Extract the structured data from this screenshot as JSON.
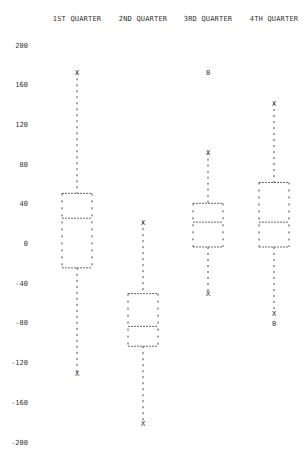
{
  "chart_data": {
    "type": "boxplot",
    "title": "",
    "xlabel": "",
    "ylabel": "",
    "categories": [
      "1ST QUARTER",
      "2ND QUARTER",
      "3RD QUARTER",
      "4TH QUARTER"
    ],
    "y_ticks": [
      "200",
      "160",
      "120",
      "80",
      "40",
      "0",
      "-40",
      "-80",
      "-120",
      "-160",
      "-200"
    ],
    "ylim": [
      -200,
      200
    ],
    "grid": false,
    "legend": null,
    "series": [
      {
        "name": "1ST QUARTER",
        "whisker_high": 173,
        "q3": 51,
        "median": 26,
        "q1": -24,
        "whisker_low": -130,
        "outliers": []
      },
      {
        "name": "2ND QUARTER",
        "whisker_high": 22,
        "q3": -50,
        "median": -83,
        "q1": -103,
        "whisker_low": -181,
        "outliers": []
      },
      {
        "name": "3RD QUARTER",
        "whisker_high": 92,
        "q3": 41,
        "median": 22,
        "q1": -3,
        "whisker_low": -50,
        "outliers": [
          173
        ]
      },
      {
        "name": "4TH QUARTER",
        "whisker_high": 142,
        "q3": 62,
        "median": 22,
        "q1": -3,
        "whisker_low": -70,
        "outliers": [
          -80
        ]
      }
    ],
    "markers": {
      "whisker_end": "X",
      "outlier": "0"
    }
  }
}
